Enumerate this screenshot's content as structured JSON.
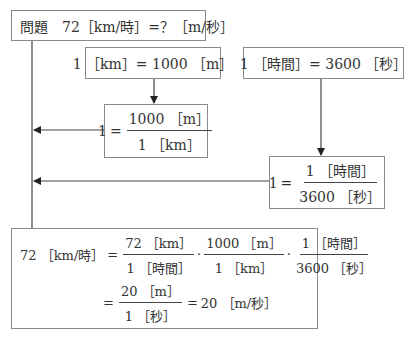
{
  "problem": {
    "label": "問題",
    "expression": "72［km/時］=？［m/秒］"
  },
  "conversion_km": {
    "text": "1 ［km］= 1000 ［m］",
    "ratio": {
      "lhs": "1",
      "eq": "=",
      "numerator": "1000 ［m］",
      "denominator": "1 ［km］"
    }
  },
  "conversion_time": {
    "text": "1 ［時間］= 3600 ［秒］",
    "ratio": {
      "lhs": "1",
      "eq": "=",
      "numerator": "1 ［時間］",
      "denominator": "3600 ［秒］"
    }
  },
  "solution": {
    "lhs": "72 ［km/時］",
    "eq": "=",
    "factors": [
      {
        "numerator": "72 ［km］",
        "denominator": "1 ［時間］"
      },
      {
        "numerator": "1000 ［m］",
        "denominator": "1 ［km］"
      },
      {
        "numerator": "1 ［時間］",
        "denominator": "3600 ［秒］"
      }
    ],
    "dot": "·",
    "step2": {
      "numerator": "20 ［m］",
      "denominator": "1 ［秒］"
    },
    "result": "20 ［m/秒］"
  }
}
